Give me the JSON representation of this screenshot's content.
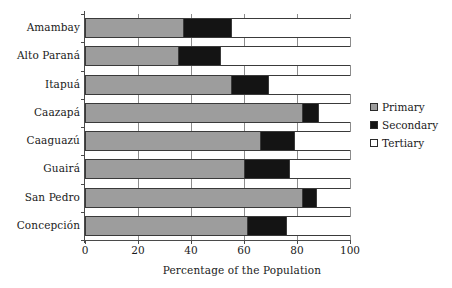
{
  "chart_data": {
    "type": "bar",
    "orientation": "horizontal",
    "stacked": true,
    "stack_mode": "percent",
    "title": "",
    "xlabel": "Percentage of the Population",
    "ylabel": "",
    "xlim": [
      0,
      100
    ],
    "xticks": [
      0,
      20,
      40,
      60,
      80,
      100
    ],
    "xtick_labels": [
      "0",
      "20",
      "40",
      "60",
      "80",
      "100"
    ],
    "grid": true,
    "grid_axis": "x",
    "legend_position": "right",
    "categories": [
      "Amambay",
      "Alto Paraná",
      "Itapuá",
      "Caazapá",
      "Caaguazú",
      "Guairá",
      "San Pedro",
      "Concepción"
    ],
    "series": [
      {
        "name": "Primary",
        "color": "#9d9d9d",
        "values": [
          37,
          35,
          55,
          82,
          66,
          60,
          82,
          61
        ]
      },
      {
        "name": "Secondary",
        "color": "#141414",
        "values": [
          18,
          16,
          14,
          6,
          13,
          17,
          5,
          15
        ]
      },
      {
        "name": "Tertiary",
        "color": "#ffffff",
        "values": [
          45,
          49,
          31,
          12,
          21,
          23,
          13,
          24
        ]
      }
    ],
    "cumulative_boundaries": [
      [
        37,
        55
      ],
      [
        35,
        51
      ],
      [
        55,
        69
      ],
      [
        82,
        88
      ],
      [
        66,
        79
      ],
      [
        60,
        77
      ],
      [
        82,
        87
      ],
      [
        61,
        76
      ]
    ]
  },
  "legend": {
    "items": [
      {
        "label": "Primary",
        "swatch": "primary"
      },
      {
        "label": "Secondary",
        "swatch": "secondary"
      },
      {
        "label": "Tertiary",
        "swatch": "tertiary"
      }
    ]
  },
  "colors": {
    "primary": "#9d9d9d",
    "secondary": "#141414",
    "tertiary": "#ffffff",
    "axis": "#4a4a4a",
    "grid": "#8c8c8c",
    "text": "#1a1a1a",
    "background": "#ffffff"
  }
}
